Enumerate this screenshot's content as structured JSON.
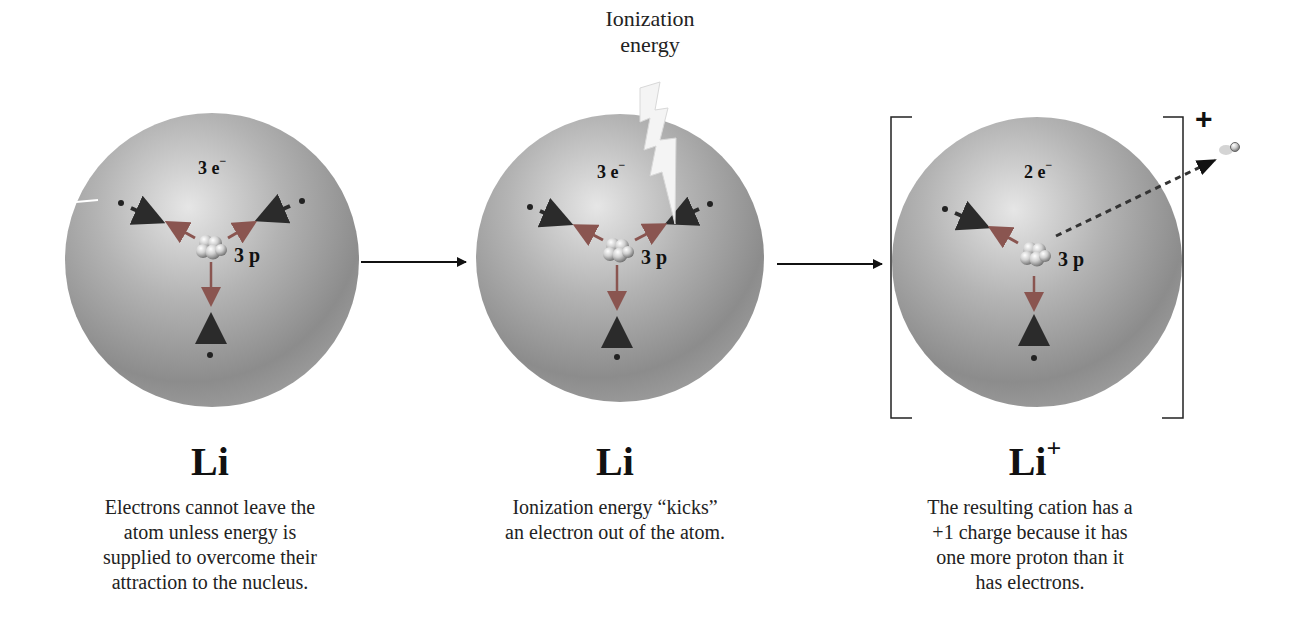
{
  "annotation": {
    "ionization_label_line1": "Ionization",
    "ionization_label_line2": "energy"
  },
  "panels": [
    {
      "id": "neutral-atom",
      "electron_count": "3 e",
      "electron_sign": "−",
      "proton_count": "3 p",
      "symbol": "Li",
      "symbol_charge": "",
      "caption_lines": [
        "Electrons cannot leave the",
        "atom unless energy is",
        "supplied to overcome their",
        "attraction to the nucleus."
      ]
    },
    {
      "id": "ionizing-atom",
      "electron_count": "3 e",
      "electron_sign": "−",
      "proton_count": "3 p",
      "symbol": "Li",
      "symbol_charge": "",
      "caption_lines": [
        "Ionization energy “kicks”",
        "an electron out of the atom."
      ]
    },
    {
      "id": "cation",
      "electron_count": "2 e",
      "electron_sign": "−",
      "proton_count": "3 p",
      "symbol": "Li",
      "symbol_charge": "+",
      "bracket_charge": "+",
      "caption_lines": [
        "The resulting cation has a",
        "+1 charge because it has",
        "one more proton than it",
        "has electrons."
      ]
    }
  ],
  "colors": {
    "sphere_light": "#e4e4e4",
    "sphere_mid": "#a9a9a9",
    "sphere_dark": "#7d7d7d",
    "arrow_dark": "#2b2b2b",
    "arrow_red": "#8a4a44",
    "text": "#111111"
  }
}
